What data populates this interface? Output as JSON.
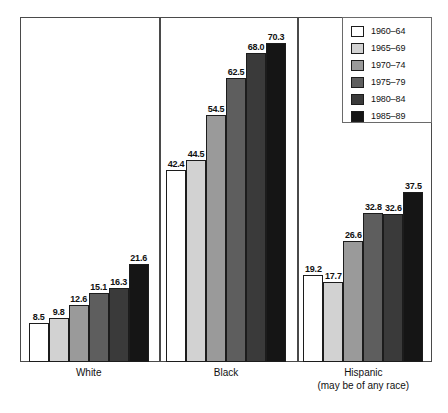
{
  "chart_data": {
    "type": "bar",
    "title": "",
    "subtitle": "",
    "xlabel": "",
    "ylabel": "",
    "ylim": [
      0,
      76
    ],
    "grid": false,
    "legend_position": "top-right",
    "categories": [
      "White",
      "Black",
      "Hispanic"
    ],
    "category_labels": [
      {
        "main": "White",
        "sub": ""
      },
      {
        "main": "Black",
        "sub": ""
      },
      {
        "main": "Hispanic",
        "sub": "(may be of any race)"
      }
    ],
    "series": [
      {
        "name": "1960–64",
        "color": "#ffffff",
        "values": [
          8.5,
          42.4,
          19.2
        ]
      },
      {
        "name": "1965–69",
        "color": "#d2d2d2",
        "values": [
          9.8,
          44.5,
          17.7
        ]
      },
      {
        "name": "1970–74",
        "color": "#9a9a9a",
        "values": [
          12.6,
          54.5,
          26.6
        ]
      },
      {
        "name": "1975–79",
        "color": "#5e5e5e",
        "values": [
          15.1,
          62.5,
          32.8
        ]
      },
      {
        "name": "1980–84",
        "color": "#3a3a3a",
        "values": [
          16.3,
          68.0,
          32.6
        ]
      },
      {
        "name": "1985–89",
        "color": "#151515",
        "values": [
          21.6,
          70.3,
          37.5
        ]
      }
    ],
    "value_labels": {
      "White": [
        "8.5",
        "9.8",
        "12.6",
        "15.1",
        "16.3",
        "21.6"
      ],
      "Black": [
        "42.4",
        "44.5",
        "54.5",
        "62.5",
        "68.0",
        "70.3"
      ],
      "Hispanic": [
        "19.2",
        "17.7",
        "26.6",
        "32.8",
        "32.6",
        "37.5"
      ]
    }
  },
  "legend": {
    "entries": [
      {
        "label": "1960–64",
        "color": "#ffffff"
      },
      {
        "label": "1965–69",
        "color": "#d2d2d2"
      },
      {
        "label": "1970–74",
        "color": "#9a9a9a"
      },
      {
        "label": "1975–79",
        "color": "#5e5e5e"
      },
      {
        "label": "1980–84",
        "color": "#3a3a3a"
      },
      {
        "label": "1985–89",
        "color": "#151515"
      }
    ]
  },
  "colors": {
    "frame": "#4a4a4a",
    "bar_outline": "#1c1c1c",
    "text": "#111111",
    "background": "#ffffff"
  }
}
